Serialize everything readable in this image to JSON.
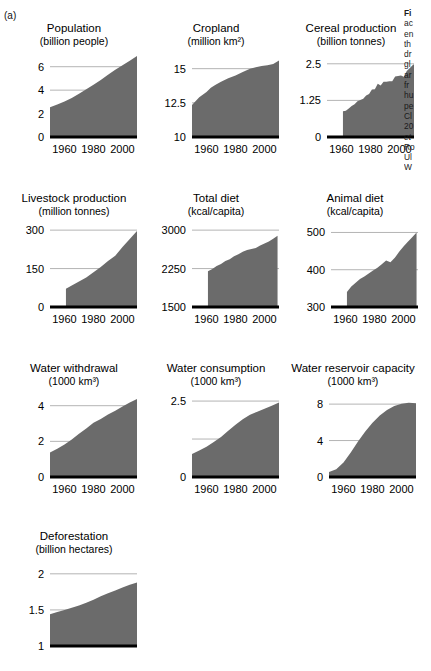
{
  "figure": {
    "panel_label": "(a)",
    "fill_color": "#6b6b6b",
    "axis_color": "#000000",
    "grid_color": "#b4b4b4"
  },
  "caption_lines": [
    {
      "text": "Fi",
      "style": "bold"
    },
    {
      "text": "ac",
      "style": "normal"
    },
    {
      "text": "en",
      "style": "normal"
    },
    {
      "text": "th",
      "style": "normal"
    },
    {
      "text": "dr",
      "style": "normal"
    },
    {
      "text": "gl",
      "style": "normal"
    },
    {
      "text": "ar",
      "style": "normal"
    },
    {
      "text": "fr",
      "style": "normal"
    },
    {
      "text": "hu",
      "style": "normal"
    },
    {
      "text": "pe",
      "style": "normal"
    },
    {
      "text": "Cl",
      "style": "normal"
    },
    {
      "text": "20",
      "style": "normal"
    },
    {
      "text": "et",
      "style": "italic"
    },
    {
      "text": "Ro",
      "style": "normal"
    },
    {
      "text": "Ul",
      "style": "normal"
    },
    {
      "text": "W",
      "style": "normal"
    }
  ],
  "chart_data": [
    {
      "id": "population",
      "type": "area",
      "title": "Population",
      "subtitle": "(billion people)",
      "xlabel": "",
      "ylabel": "",
      "xlim": [
        1950,
        2010
      ],
      "ylim": [
        0,
        7
      ],
      "xticks": [
        1960,
        1980,
        2000
      ],
      "xtick_labels": [
        "1960",
        "1980",
        "2000"
      ],
      "yticks": [
        0,
        2,
        4,
        6
      ],
      "ytick_labels": [
        "0",
        "2",
        "4",
        "6"
      ],
      "grid": true,
      "x": [
        1950,
        1955,
        1960,
        1965,
        1970,
        1975,
        1980,
        1985,
        1990,
        1995,
        2000,
        2005,
        2010
      ],
      "values": [
        2.53,
        2.77,
        3.03,
        3.33,
        3.7,
        4.07,
        4.45,
        4.86,
        5.32,
        5.74,
        6.13,
        6.51,
        6.92
      ]
    },
    {
      "id": "cropland",
      "type": "area",
      "title": "Cropland",
      "subtitle": "(million km²)",
      "xlabel": "",
      "ylabel": "",
      "xlim": [
        1950,
        2010
      ],
      "ylim": [
        10,
        16
      ],
      "xticks": [
        1960,
        1980,
        2000
      ],
      "xtick_labels": [
        "1960",
        "1980",
        "2000"
      ],
      "yticks": [
        10,
        12.5,
        15
      ],
      "ytick_labels": [
        "10",
        "12.5",
        "15"
      ],
      "grid": true,
      "x": [
        1950,
        1955,
        1960,
        1963,
        1966,
        1970,
        1975,
        1980,
        1985,
        1990,
        1994,
        1998,
        2002,
        2006,
        2010
      ],
      "values": [
        12.35,
        12.9,
        13.3,
        13.6,
        13.8,
        14.05,
        14.3,
        14.5,
        14.75,
        15.0,
        15.1,
        15.2,
        15.25,
        15.35,
        15.6
      ]
    },
    {
      "id": "cereal-production",
      "type": "area",
      "title": "Cereal production",
      "subtitle": "(billion tonnes)",
      "xlabel": "",
      "ylabel": "",
      "xlim": [
        1950,
        2010
      ],
      "ylim": [
        0,
        2.8
      ],
      "xticks": [
        1960,
        1980,
        2000
      ],
      "xtick_labels": [
        "1960",
        "1980",
        "2000"
      ],
      "yticks": [
        0,
        1.25,
        2.5
      ],
      "ytick_labels": [
        "0",
        "1.25",
        "2.5"
      ],
      "grid": true,
      "x": [
        1961,
        1963,
        1965,
        1967,
        1969,
        1971,
        1973,
        1975,
        1977,
        1979,
        1981,
        1983,
        1985,
        1987,
        1989,
        1991,
        1993,
        1995,
        1997,
        1999,
        2001,
        2003,
        2005,
        2007,
        2009,
        2010
      ],
      "values": [
        0.88,
        0.9,
        0.97,
        1.06,
        1.12,
        1.22,
        1.26,
        1.31,
        1.42,
        1.47,
        1.62,
        1.63,
        1.82,
        1.76,
        1.89,
        1.89,
        1.9,
        1.9,
        2.07,
        2.08,
        2.1,
        2.06,
        2.25,
        2.35,
        2.45,
        2.48
      ]
    },
    {
      "id": "livestock-production",
      "type": "area",
      "title": "Livestock production",
      "subtitle": "(million tonnes)",
      "xlabel": "",
      "ylabel": "",
      "xlim": [
        1950,
        2010
      ],
      "ylim": [
        0,
        320
      ],
      "xticks": [
        1960,
        1980,
        2000
      ],
      "xtick_labels": [
        "1960",
        "1980",
        "2000"
      ],
      "yticks": [
        0,
        150,
        300
      ],
      "ytick_labels": [
        "0",
        "150",
        "300"
      ],
      "grid": true,
      "x": [
        1961,
        1965,
        1970,
        1975,
        1980,
        1985,
        1990,
        1995,
        2000,
        2005,
        2010
      ],
      "values": [
        71,
        84,
        100,
        115,
        136,
        156,
        180,
        200,
        234,
        265,
        297
      ]
    },
    {
      "id": "total-diet",
      "type": "area",
      "title": "Total diet",
      "subtitle": "(kcal/capita)",
      "xlabel": "",
      "ylabel": "",
      "xlim": [
        1950,
        2010
      ],
      "ylim": [
        1500,
        3100
      ],
      "xticks": [
        1960,
        1980,
        2000
      ],
      "xtick_labels": [
        "1960",
        "1980",
        "2000"
      ],
      "yticks": [
        1500,
        2250,
        3000
      ],
      "ytick_labels": [
        "1500",
        "2250",
        "3000"
      ],
      "grid": true,
      "x": [
        1961,
        1964,
        1967,
        1970,
        1973,
        1976,
        1979,
        1982,
        1985,
        1988,
        1991,
        1994,
        1997,
        2000,
        2003,
        2006,
        2009
      ],
      "values": [
        2200,
        2240,
        2300,
        2340,
        2400,
        2430,
        2490,
        2530,
        2580,
        2610,
        2630,
        2650,
        2700,
        2740,
        2780,
        2830,
        2890
      ]
    },
    {
      "id": "animal-diet",
      "type": "area",
      "title": "Animal diet",
      "subtitle": "(kcal/capita)",
      "xlabel": "",
      "ylabel": "",
      "xlim": [
        1950,
        2010
      ],
      "ylim": [
        300,
        520
      ],
      "xticks": [
        1960,
        1980,
        2000
      ],
      "xtick_labels": [
        "1960",
        "1980",
        "2000"
      ],
      "yticks": [
        300,
        400,
        500
      ],
      "ytick_labels": [
        "300",
        "400",
        "500"
      ],
      "grid": true,
      "x": [
        1961,
        1964,
        1967,
        1970,
        1973,
        1976,
        1979,
        1982,
        1985,
        1988,
        1991,
        1994,
        1997,
        2000,
        2003,
        2006,
        2009
      ],
      "values": [
        340,
        355,
        365,
        375,
        382,
        390,
        398,
        405,
        415,
        425,
        420,
        432,
        448,
        462,
        475,
        487,
        500
      ]
    },
    {
      "id": "water-withdrawal",
      "type": "area",
      "title": "Water withdrawal",
      "subtitle": "(1000 km³)",
      "xlabel": "",
      "ylabel": "",
      "xlim": [
        1950,
        2010
      ],
      "ylim": [
        0,
        4.6
      ],
      "xticks": [
        1960,
        1980,
        2000
      ],
      "xtick_labels": [
        "1960",
        "1980",
        "2000"
      ],
      "yticks": [
        0,
        2,
        4
      ],
      "ytick_labels": [
        "0",
        "2",
        "4"
      ],
      "grid": true,
      "x": [
        1950,
        1955,
        1960,
        1965,
        1970,
        1975,
        1980,
        1985,
        1990,
        1995,
        2000,
        2005,
        2010
      ],
      "values": [
        1.38,
        1.58,
        1.82,
        2.1,
        2.42,
        2.72,
        3.05,
        3.25,
        3.5,
        3.72,
        3.95,
        4.18,
        4.38
      ]
    },
    {
      "id": "water-consumption",
      "type": "area",
      "title": "Water consumption",
      "subtitle": "(1000 km³)",
      "xlabel": "",
      "ylabel": "",
      "xlim": [
        1950,
        2010
      ],
      "ylim": [
        0,
        2.7
      ],
      "xticks": [
        1960,
        1980,
        2000
      ],
      "xtick_labels": [
        "1960",
        "1980",
        "2000"
      ],
      "yticks": [
        0,
        1.25,
        2.5
      ],
      "ytick_labels": [
        "0",
        "",
        "2.5"
      ],
      "grid": true,
      "x": [
        1950,
        1955,
        1960,
        1965,
        1970,
        1975,
        1980,
        1985,
        1990,
        1995,
        2000,
        2005,
        2010
      ],
      "values": [
        0.76,
        0.87,
        1.0,
        1.15,
        1.32,
        1.52,
        1.72,
        1.9,
        2.05,
        2.15,
        2.25,
        2.35,
        2.45
      ]
    },
    {
      "id": "water-reservoir-capacity",
      "type": "area",
      "title": "Water reservoir capacity",
      "subtitle": "(1000 km³)",
      "xlabel": "",
      "ylabel": "",
      "xlim": [
        1950,
        2010
      ],
      "ylim": [
        0,
        9
      ],
      "xticks": [
        1960,
        1980,
        2000
      ],
      "xtick_labels": [
        "1960",
        "1980",
        "2000"
      ],
      "yticks": [
        0,
        4,
        8
      ],
      "ytick_labels": [
        "0",
        "4",
        "8"
      ],
      "grid": true,
      "x": [
        1950,
        1955,
        1960,
        1965,
        1970,
        1975,
        1980,
        1985,
        1990,
        1995,
        2000,
        2005,
        2010
      ],
      "values": [
        0.55,
        0.85,
        1.6,
        2.7,
        3.9,
        5.0,
        5.95,
        6.75,
        7.35,
        7.8,
        8.05,
        8.15,
        8.1
      ]
    },
    {
      "id": "deforestation",
      "type": "area",
      "title": "Deforestation",
      "subtitle": "(billion hectares)",
      "xlabel": "",
      "ylabel": "",
      "xlim": [
        1950,
        2010
      ],
      "ylim": [
        1,
        2.15
      ],
      "xticks": [],
      "xtick_labels": [],
      "yticks": [
        1,
        1.5,
        2
      ],
      "ytick_labels": [
        "1",
        "1.5",
        "2"
      ],
      "grid": true,
      "x": [
        1950,
        1955,
        1960,
        1965,
        1970,
        1975,
        1980,
        1985,
        1990,
        1995,
        2000,
        2005,
        2010
      ],
      "values": [
        1.44,
        1.47,
        1.5,
        1.53,
        1.56,
        1.6,
        1.64,
        1.69,
        1.73,
        1.77,
        1.81,
        1.85,
        1.88
      ]
    }
  ]
}
